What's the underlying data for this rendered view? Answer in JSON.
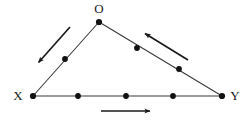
{
  "figure": {
    "type": "geometry-diagram",
    "shape": "triangle",
    "title": "",
    "background_color": "#ffffff",
    "line_color": "#3a3a3a",
    "point_color": "#111111",
    "arrow_color": "#1a1a1a",
    "label_color": "#1a1a1a"
  },
  "vertices": [
    {
      "id": "O",
      "label": "O",
      "x": 99,
      "y": 22,
      "label_x": 99,
      "label_y": 13
    },
    {
      "id": "X",
      "label": "X",
      "x": 33,
      "y": 96,
      "label_x": 18,
      "label_y": 100
    },
    {
      "id": "Y",
      "label": "Y",
      "x": 222,
      "y": 96,
      "label_x": 235,
      "label_y": 100
    }
  ],
  "sides": [
    {
      "id": "side-OX",
      "from": "O",
      "to": "X",
      "x1": 99,
      "y1": 22,
      "x2": 33,
      "y2": 96
    },
    {
      "id": "side-XY",
      "from": "X",
      "to": "Y",
      "x1": 33,
      "y1": 96,
      "x2": 222,
      "y2": 96
    },
    {
      "id": "side-OY",
      "from": "O",
      "to": "Y",
      "x1": 99,
      "y1": 22,
      "x2": 222,
      "y2": 96
    }
  ],
  "marked_points": [
    {
      "id": "point-ox-1",
      "on_side": "side-OX",
      "x": 65,
      "y": 59
    },
    {
      "id": "point-xy-1",
      "on_side": "side-XY",
      "x": 78,
      "y": 96
    },
    {
      "id": "point-xy-2",
      "on_side": "side-XY",
      "x": 126,
      "y": 96
    },
    {
      "id": "point-xy-3",
      "on_side": "side-XY",
      "x": 173,
      "y": 96
    },
    {
      "id": "point-oy-1",
      "on_side": "side-OY",
      "x": 137,
      "y": 48
    },
    {
      "id": "point-oy-2",
      "on_side": "side-OY",
      "x": 179,
      "y": 69
    }
  ],
  "direction_arrows": [
    {
      "id": "arrow-left",
      "describes_side": "side-OX",
      "direction": "down-left",
      "meaning": "O to X",
      "x1": 70,
      "y1": 27,
      "x2": 37,
      "y2": 64
    },
    {
      "id": "arrow-bottom",
      "describes_side": "side-XY",
      "direction": "right",
      "meaning": "X to Y",
      "x1": 101,
      "y1": 111,
      "x2": 153,
      "y2": 111
    },
    {
      "id": "arrow-right",
      "describes_side": "side-OY",
      "direction": "up-left",
      "meaning": "Y to O",
      "x1": 188,
      "y1": 60,
      "x2": 143,
      "y2": 32
    }
  ],
  "counts": {
    "vertices": 3,
    "marked_points": 6,
    "arrows": 3
  }
}
